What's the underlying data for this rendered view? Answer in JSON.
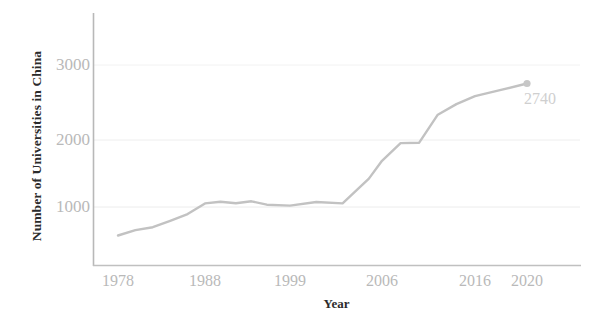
{
  "chart_data": {
    "type": "line",
    "title": "",
    "xlabel": "Year",
    "ylabel": "Number of Universities in China",
    "xtick_labels": [
      "1978",
      "1988",
      "1999",
      "2006",
      "2016",
      "2020"
    ],
    "xtick_values": [
      1978,
      1988,
      1999,
      2006,
      2016,
      2020
    ],
    "ytick_labels": [
      "1000",
      "2000",
      "3000"
    ],
    "ytick_values": [
      1000,
      2000,
      3000
    ],
    "ylim": [
      0,
      3400
    ],
    "xlim": [
      1976,
      2022
    ],
    "grid": "horizontal-faint",
    "legend": "none",
    "series_color": "#c2c2c2",
    "marker_color": "#c7c7c7",
    "annotation": {
      "text": "2740",
      "x": 2020,
      "y": 2740
    },
    "x": [
      1978,
      1980,
      1982,
      1984,
      1986,
      1988,
      1990,
      1992,
      1994,
      1996,
      1999,
      2001,
      2003,
      2005,
      2006,
      2008,
      2010,
      2012,
      2014,
      2016,
      2018,
      2020
    ],
    "values": [
      598,
      675,
      715,
      805,
      900,
      1050,
      1075,
      1053,
      1080,
      1032,
      1020,
      1071,
      1050,
      1400,
      1650,
      1900,
      1905,
      2300,
      2450,
      2560,
      2650,
      2740
    ],
    "series": [
      {
        "name": "Number of Universities in China",
        "color": "#c2c2c2",
        "values": [
          598,
          675,
          715,
          805,
          900,
          1050,
          1075,
          1053,
          1080,
          1032,
          1020,
          1071,
          1050,
          1400,
          1650,
          1900,
          1905,
          2300,
          2450,
          2560,
          2650,
          2740
        ]
      }
    ]
  },
  "axis": {
    "x_title": "Year",
    "y_title": "Number of Universities in China"
  },
  "ticks": {
    "y": [
      {
        "label": "3000",
        "px": 65
      },
      {
        "label": "2000",
        "px": 140
      },
      {
        "label": "1000",
        "px": 207
      }
    ],
    "x": [
      {
        "label": "1978",
        "px": 118
      },
      {
        "label": "1988",
        "px": 205
      },
      {
        "label": "1999",
        "px": 290
      },
      {
        "label": "2006",
        "px": 382
      },
      {
        "label": "2016",
        "px": 475
      },
      {
        "label": "2020",
        "px": 527
      }
    ]
  },
  "annotation": {
    "value_label": "2740"
  },
  "colors": {
    "line": "#c2c2c2",
    "axis": "#b4b4b4",
    "grid": "#efefef",
    "tick_text": "#b9b9b9",
    "title_text": "#2b2b2b",
    "annotation_text": "#cfcfcf",
    "background": "#ffffff"
  }
}
